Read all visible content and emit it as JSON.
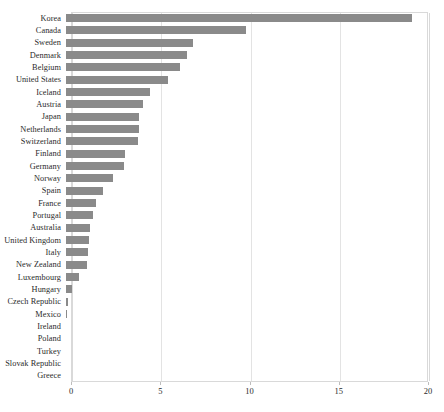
{
  "chart_data": {
    "type": "bar",
    "orientation": "horizontal",
    "title": "",
    "subtitle": "",
    "xlabel": "",
    "ylabel": "",
    "xlim": [
      0,
      20
    ],
    "ylim": null,
    "grid": true,
    "gridlines_x": [
      0,
      5,
      10,
      15,
      20
    ],
    "legend": null,
    "legend_position": "none",
    "bar_color": "#8a8a8a",
    "axis_color": "#d9d9d9",
    "gridline_color": "#e3e3e3",
    "label_color": "#2b2b2b",
    "xticks": [
      "0",
      "5",
      "10",
      "15",
      "20"
    ],
    "xtick_values": [
      0,
      5,
      10,
      15,
      20
    ],
    "categories": [
      "Korea",
      "Canada",
      "Sweden",
      "Denmark",
      "Belgium",
      "United States",
      "Iceland",
      "Austria",
      "Japan",
      "Netherlands",
      "Switzerland",
      "Finland",
      "Germany",
      "Norway",
      "Spain",
      "France",
      "Portugal",
      "Australia",
      "United Kingdom",
      "Italy",
      "New Zealand",
      "Luxembourg",
      "Hungary",
      "Czech Republic",
      "Mexico",
      "Ireland",
      "Poland",
      "Turkey",
      "Slovak Republic",
      "Greece"
    ],
    "values": [
      19.4,
      10.1,
      7.1,
      6.8,
      6.4,
      5.7,
      4.7,
      4.3,
      4.1,
      4.1,
      4.05,
      3.3,
      3.25,
      2.65,
      2.1,
      1.7,
      1.5,
      1.35,
      1.3,
      1.25,
      1.2,
      0.75,
      0.35,
      0.1,
      0.05,
      0,
      0,
      0,
      0,
      0
    ]
  }
}
